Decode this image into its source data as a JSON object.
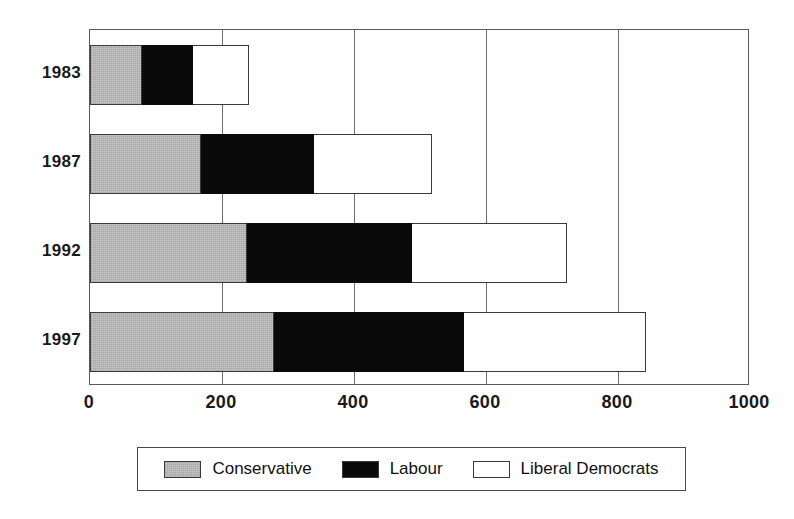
{
  "chart_data": {
    "type": "bar",
    "orientation": "horizontal",
    "stacked": true,
    "title": "",
    "xlabel": "",
    "ylabel": "",
    "categories": [
      "1983",
      "1987",
      "1992",
      "1997"
    ],
    "series": [
      {
        "name": "Conservative",
        "color": "#bdbdbd",
        "values": [
          79,
          168,
          238,
          279
        ]
      },
      {
        "name": "Labour",
        "color": "#0a0a0a",
        "values": [
          79,
          173,
          252,
          289
        ]
      },
      {
        "name": "Liberal Democrats",
        "color": "#ffffff",
        "values": [
          86,
          180,
          236,
          277
        ]
      }
    ],
    "totals": [
      244,
      521,
      726,
      845
    ],
    "xlim": [
      0,
      1000
    ],
    "xticks": [
      0,
      200,
      400,
      600,
      800,
      1000
    ],
    "xtick_labels": [
      "0",
      "200",
      "400",
      "600",
      "800",
      "1000"
    ],
    "grid": true,
    "legend_position": "bottom"
  },
  "legend": {
    "entries": [
      {
        "label": "Conservative",
        "swatch": "conservative-swatch"
      },
      {
        "label": "Labour",
        "swatch": "labour-swatch"
      },
      {
        "label": "Liberal Democrats",
        "swatch": "libdem-swatch"
      }
    ]
  }
}
